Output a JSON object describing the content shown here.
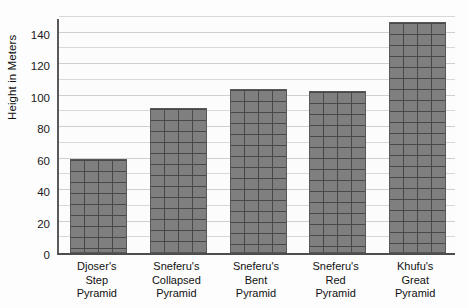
{
  "chart_data": {
    "type": "bar",
    "title": "",
    "xlabel": "",
    "ylabel": "Height in Meters",
    "categories": [
      "Djoser's\nStep\nPyramid",
      "Sneferu's\nCollapsed\nPyramid",
      "Sneferu's\nBent\nPyramid",
      "Sneferu's\nRed\nPyramid",
      "Khufu's\nGreat\nPyramid"
    ],
    "values": [
      60,
      92,
      104,
      103,
      147
    ],
    "ylim": [
      0,
      150
    ],
    "y_ticks": [
      0,
      20,
      40,
      60,
      80,
      100,
      120,
      140
    ],
    "y_tick_labels": [
      "0",
      "20",
      "40",
      "60",
      "80",
      "100",
      "120",
      "140"
    ],
    "minor_gridline_step": 10,
    "grid": true,
    "legend": "none",
    "bar_fill": "#7f7f7f",
    "bar_texture": "brick",
    "bar_border": "#585858",
    "gridline_color": "#d8d8d8",
    "axis_color": "#4d4d4d",
    "background": "#fdfdfd"
  },
  "axes": {
    "y_title": "Height in Meters"
  }
}
